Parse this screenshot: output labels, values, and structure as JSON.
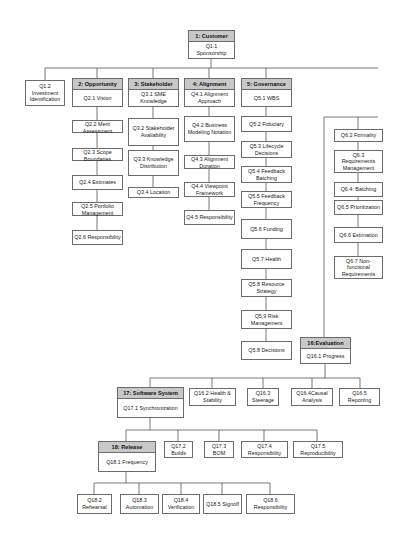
{
  "diagram": {
    "type": "hierarchy",
    "nodes": [
      {
        "id": "customer",
        "title": "1: Customer",
        "text": "Q1.1 Sponsorship",
        "x": 188,
        "y": 30,
        "w": 47,
        "h": 29
      },
      {
        "id": "q1_2",
        "title": "",
        "text": "Q1.2 Investment Identification",
        "x": 25,
        "y": 80,
        "w": 40,
        "h": 26
      },
      {
        "id": "opportunity",
        "title": "2: Opportunity",
        "text": "Q2.1 Vision",
        "x": 72,
        "y": 78,
        "w": 51,
        "h": 29
      },
      {
        "id": "stakeholder",
        "title": "3: Stakeholder",
        "text": "Q3.1 SME Knowledge",
        "x": 128,
        "y": 78,
        "w": 51,
        "h": 29
      },
      {
        "id": "alignment",
        "title": "4: Alignment",
        "text": "Q4.1 Alignment Approach",
        "x": 184,
        "y": 78,
        "w": 51,
        "h": 29
      },
      {
        "id": "governance",
        "title": "5: Governance",
        "text": "Q5.1 WBS",
        "x": 241,
        "y": 78,
        "w": 51,
        "h": 29
      },
      {
        "id": "q2_2",
        "title": "",
        "text": "Q2.2 Merit Assessment",
        "x": 72,
        "y": 120,
        "w": 51,
        "h": 13
      },
      {
        "id": "q2_3",
        "title": "",
        "text": "Q2.3 Scope Boundaries",
        "x": 72,
        "y": 148,
        "w": 51,
        "h": 13
      },
      {
        "id": "q2_4",
        "title": "",
        "text": "Q2.4 Estimates",
        "x": 72,
        "y": 175,
        "w": 51,
        "h": 15
      },
      {
        "id": "q2_5",
        "title": "",
        "text": "Q2.5 Portfolio Management",
        "x": 72,
        "y": 202,
        "w": 51,
        "h": 14
      },
      {
        "id": "q2_6",
        "title": "",
        "text": "Q2.6 Responsibility",
        "x": 72,
        "y": 230,
        "w": 51,
        "h": 15
      },
      {
        "id": "q3_2",
        "title": "",
        "text": "Q3.2 Stakeholder Availability",
        "x": 128,
        "y": 118,
        "w": 51,
        "h": 28
      },
      {
        "id": "q3_3",
        "title": "",
        "text": "Q3.3 Knowledge Distribution",
        "x": 128,
        "y": 150,
        "w": 51,
        "h": 26
      },
      {
        "id": "q3_4",
        "title": "",
        "text": "Q3.4 Location",
        "x": 128,
        "y": 187,
        "w": 51,
        "h": 11
      },
      {
        "id": "q4_2",
        "title": "",
        "text": "Q4.2 Business Modeling Notation",
        "x": 184,
        "y": 116,
        "w": 51,
        "h": 26
      },
      {
        "id": "q4_3",
        "title": "",
        "text": "Q4.3 Alignment Duration",
        "x": 184,
        "y": 155,
        "w": 51,
        "h": 14
      },
      {
        "id": "q4_4",
        "title": "",
        "text": "Q4.4 Viewpoint Framework",
        "x": 184,
        "y": 182,
        "w": 51,
        "h": 15
      },
      {
        "id": "q4_5",
        "title": "",
        "text": "Q4.5 Responsibility",
        "x": 184,
        "y": 210,
        "w": 51,
        "h": 15
      },
      {
        "id": "q5_2",
        "title": "",
        "text": "Q5.2 Fiduciary",
        "x": 241,
        "y": 116,
        "w": 51,
        "h": 16
      },
      {
        "id": "q5_3",
        "title": "",
        "text": "Q5.3 Lifecycle Decisions",
        "x": 241,
        "y": 141,
        "w": 51,
        "h": 17
      },
      {
        "id": "q5_4",
        "title": "",
        "text": "Q5.4 Feedback Batching",
        "x": 241,
        "y": 166,
        "w": 51,
        "h": 17
      },
      {
        "id": "q5_5",
        "title": "",
        "text": "Q5.5 Feedback Frequency",
        "x": 241,
        "y": 191,
        "w": 51,
        "h": 17
      },
      {
        "id": "q5_6",
        "title": "",
        "text": "Q5.6 Funding",
        "x": 241,
        "y": 219,
        "w": 51,
        "h": 20
      },
      {
        "id": "q5_7",
        "title": "",
        "text": "Q5.7 Health",
        "x": 241,
        "y": 249,
        "w": 51,
        "h": 20
      },
      {
        "id": "q5_8r",
        "title": "",
        "text": "Q5.8 Resource Strategy",
        "x": 241,
        "y": 279,
        "w": 51,
        "h": 18
      },
      {
        "id": "q5_9",
        "title": "",
        "text": "Q5.9 Risk Management",
        "x": 241,
        "y": 310,
        "w": 51,
        "h": 19
      },
      {
        "id": "q5_8d",
        "title": "",
        "text": "Q5.8 Decisions",
        "x": 241,
        "y": 341,
        "w": 51,
        "h": 19
      },
      {
        "id": "q6_2",
        "title": "",
        "text": "Q6.2 Formality",
        "x": 334,
        "y": 129,
        "w": 49,
        "h": 13
      },
      {
        "id": "q6_3",
        "title": "",
        "text": "Q6.3 Requirements Management",
        "x": 334,
        "y": 150,
        "w": 49,
        "h": 23
      },
      {
        "id": "q6_4",
        "title": "",
        "text": "Q6.4: Batching",
        "x": 334,
        "y": 182,
        "w": 49,
        "h": 15
      },
      {
        "id": "q6_5",
        "title": "",
        "text": "Q6.5 Prioritization",
        "x": 334,
        "y": 200,
        "w": 49,
        "h": 15
      },
      {
        "id": "q6_6",
        "title": "",
        "text": "Q6.6 Estimation",
        "x": 334,
        "y": 227,
        "w": 49,
        "h": 16
      },
      {
        "id": "q6_7",
        "title": "",
        "text": "Q6.7 Non-functional Requirements",
        "x": 334,
        "y": 256,
        "w": 49,
        "h": 23
      },
      {
        "id": "evaluation",
        "title": "16:Evaluation",
        "text": "Q16.1 Progress",
        "x": 300,
        "y": 337,
        "w": 51,
        "h": 27
      },
      {
        "id": "software",
        "title": "17: Software System",
        "text": "Q17.1 Synchronization",
        "x": 117,
        "y": 387,
        "w": 67,
        "h": 31
      },
      {
        "id": "q16_2",
        "title": "",
        "text": "Q16.2 Health & Stability",
        "x": 189,
        "y": 388,
        "w": 47,
        "h": 18
      },
      {
        "id": "q16_3",
        "title": "",
        "text": "Q16.3 Steerage",
        "x": 247,
        "y": 388,
        "w": 32,
        "h": 18
      },
      {
        "id": "q16_4",
        "title": "",
        "text": "Q16.4Causal Analysis",
        "x": 291,
        "y": 388,
        "w": 42,
        "h": 18
      },
      {
        "id": "q16_5",
        "title": "",
        "text": "Q16.5 Reporting",
        "x": 339,
        "y": 388,
        "w": 41,
        "h": 18
      },
      {
        "id": "release",
        "title": "18: Release",
        "text": "Q18.1 Frequency",
        "x": 98,
        "y": 441,
        "w": 58,
        "h": 31
      },
      {
        "id": "q17_2",
        "title": "",
        "text": "Q17.2 Builds",
        "x": 164,
        "y": 441,
        "w": 29,
        "h": 17
      },
      {
        "id": "q17_3",
        "title": "",
        "text": "Q17.3 BOM",
        "x": 204,
        "y": 441,
        "w": 30,
        "h": 17
      },
      {
        "id": "q17_4",
        "title": "",
        "text": "Q17.4 Responsibility",
        "x": 241,
        "y": 441,
        "w": 47,
        "h": 17
      },
      {
        "id": "q17_5",
        "title": "",
        "text": "Q17.5 Reproducibility",
        "x": 293,
        "y": 441,
        "w": 50,
        "h": 17
      },
      {
        "id": "q18_2",
        "title": "",
        "text": "Q18.2 Rehearsal",
        "x": 77,
        "y": 494,
        "w": 35,
        "h": 20
      },
      {
        "id": "q18_3",
        "title": "",
        "text": "Q18.3 Automation",
        "x": 120,
        "y": 494,
        "w": 39,
        "h": 20
      },
      {
        "id": "q18_4",
        "title": "",
        "text": "Q18.4 Verification",
        "x": 162,
        "y": 494,
        "w": 38,
        "h": 20
      },
      {
        "id": "q18_5",
        "title": "",
        "text": "Q18.5 Signoff",
        "x": 203,
        "y": 494,
        "w": 39,
        "h": 20
      },
      {
        "id": "q18_6",
        "title": "",
        "text": "Q18.6 Responsibility",
        "x": 246,
        "y": 494,
        "w": 49,
        "h": 20
      }
    ]
  },
  "colors": {
    "header_fill": "#c8c8c8",
    "border": "#6b6b6b",
    "line": "#555555",
    "text": "#222222"
  }
}
